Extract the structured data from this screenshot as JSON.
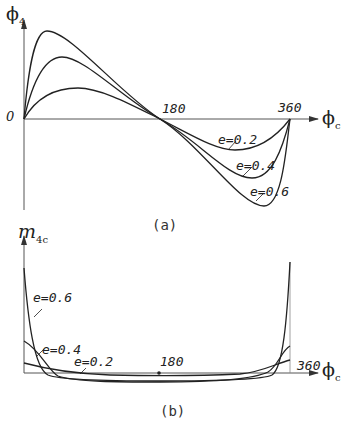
{
  "figure_a": {
    "y_axis_label": "ϕ",
    "y_axis_sub": "4",
    "x_axis_label": "ϕ",
    "x_axis_sub": "c",
    "origin_label": "0",
    "tick_180": "180",
    "tick_360": "360",
    "curve_labels": [
      "e=0.2",
      "e=0.4",
      "e=0.6"
    ],
    "caption": "(a)"
  },
  "figure_b": {
    "y_axis_label": "m",
    "y_axis_sub": "4c",
    "x_axis_label": "ϕ",
    "x_axis_sub": "c",
    "tick_180": "180",
    "tick_360": "360",
    "curve_labels": [
      "e=0.6",
      "e=0.4",
      "e=0.2"
    ],
    "caption": "(b)"
  },
  "colors": {
    "stroke": "#222222",
    "axis": "#555555"
  }
}
